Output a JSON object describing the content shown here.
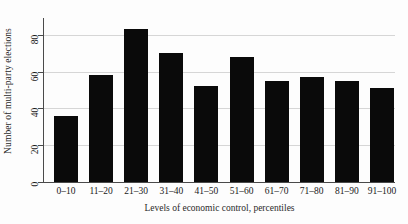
{
  "chart_data": {
    "type": "bar",
    "title": "",
    "xlabel": "Levels of economic control, percentiles",
    "ylabel": "Number of multi-party elections",
    "categories": [
      "0–10",
      "11–20",
      "21–30",
      "31–40",
      "41–50",
      "51–60",
      "61–70",
      "71–80",
      "81–90",
      "91–100"
    ],
    "values": [
      36,
      58,
      83,
      70,
      52,
      68,
      55,
      57,
      55,
      51
    ],
    "ylim": [
      0,
      88
    ],
    "yticks": [
      0,
      20,
      40,
      60,
      80
    ],
    "ytick_labels": [
      "0",
      "20",
      "40",
      "60",
      "80"
    ],
    "grid": "horizontal",
    "legend": "none",
    "bar_color": "#0a0a0a",
    "grid_color": "#d6d6d6",
    "axis_color": "#4a4a4a",
    "background": "#fdfdfd"
  }
}
